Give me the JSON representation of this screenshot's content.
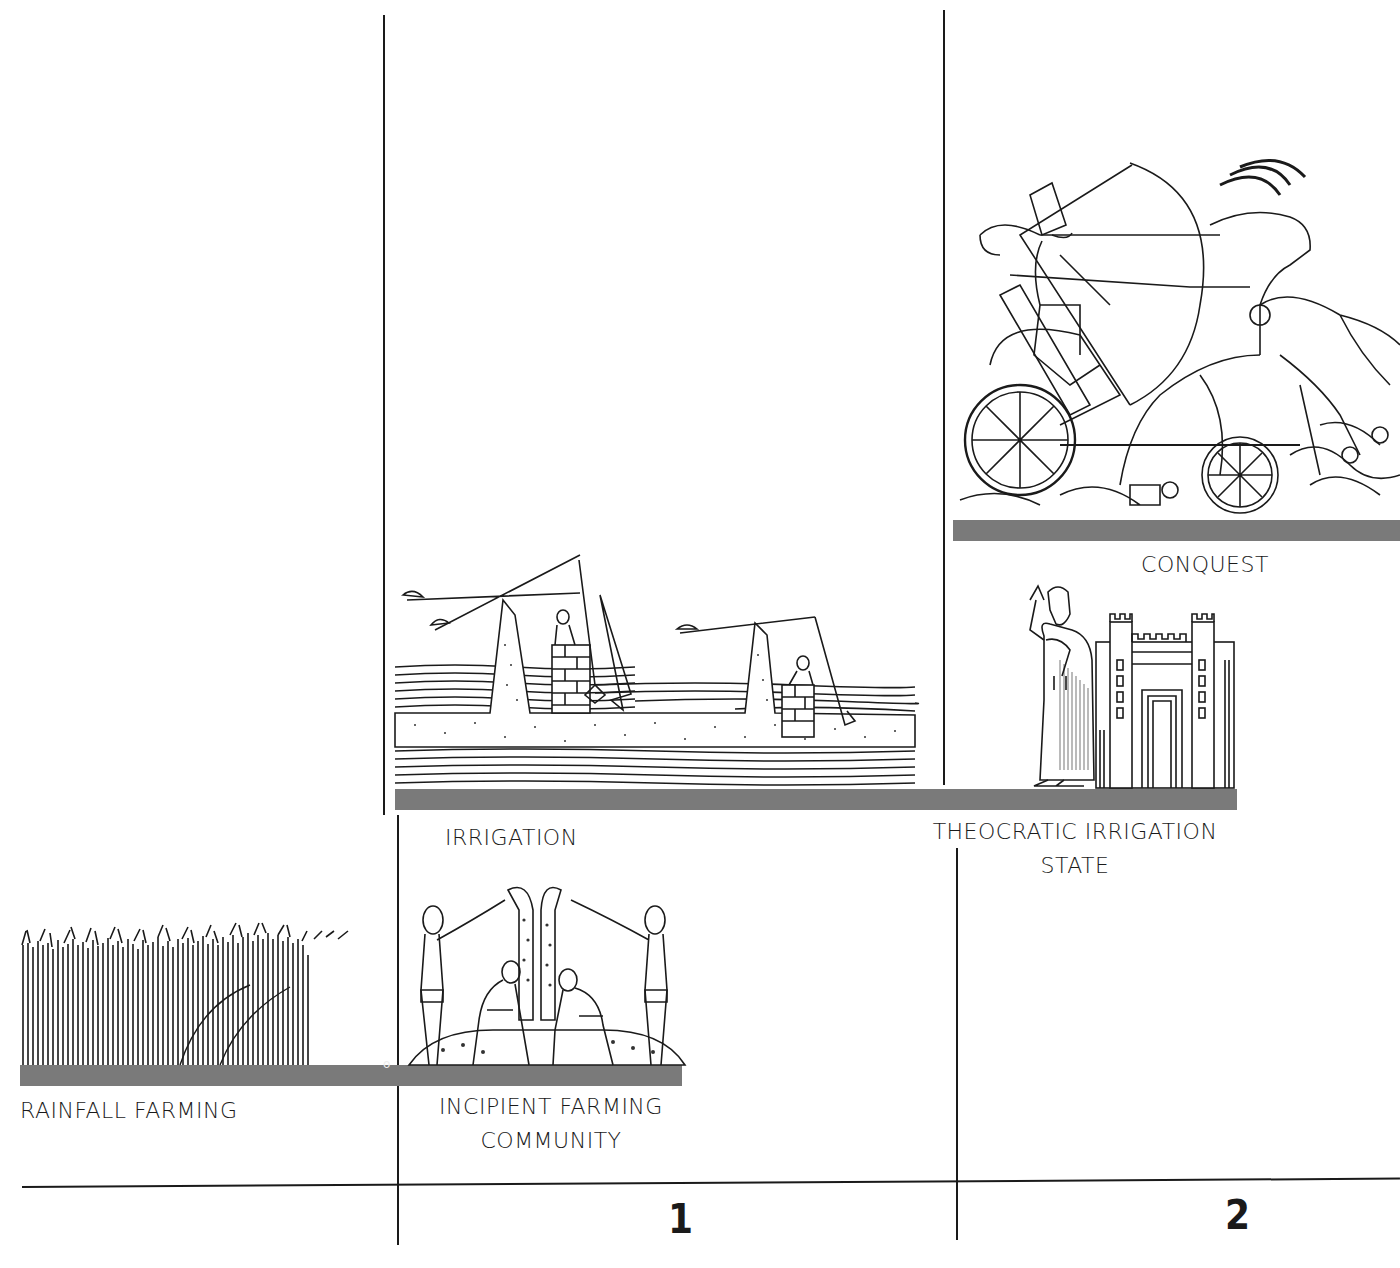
{
  "diagram": {
    "stages": [
      {
        "id": "rainfall",
        "label_lines": [
          "RAINFALL FARMING"
        ],
        "illustration": "wheat-field"
      },
      {
        "id": "incipient",
        "label_lines": [
          "INCIPIENT FARMING",
          "COMMUNITY"
        ],
        "illustration": "figures-pouring-grain"
      },
      {
        "id": "irrigation",
        "label_lines": [
          "IRRIGATION"
        ],
        "illustration": "shadoof-water-lifting"
      },
      {
        "id": "theocratic",
        "label_lines": [
          "THEOCRATIC IRRIGATION",
          "STATE"
        ],
        "illustration": "priest-king-before-temple-gate"
      },
      {
        "id": "conquest",
        "label_lines": [
          "CONQUEST"
        ],
        "illustration": "chariot-archer-battle"
      }
    ],
    "origin_marker": "o",
    "axis": {
      "period_labels": [
        "1",
        "2"
      ]
    },
    "colors": {
      "bar": "#7a7a7a",
      "ink": "#1a1a1a",
      "background": "#ffffff"
    }
  }
}
